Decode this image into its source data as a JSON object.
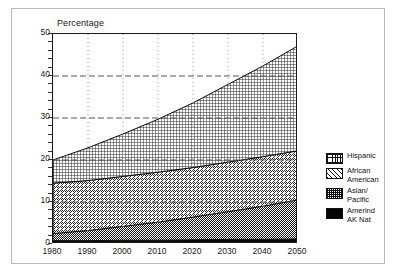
{
  "chart_data": {
    "type": "area",
    "title": "",
    "ylabel": "Percentage",
    "xlabel": "",
    "ylim": [
      0,
      50
    ],
    "xlim": [
      1980,
      2050
    ],
    "grid": true,
    "stacked": true,
    "legend_position": "right",
    "x": [
      1980,
      1990,
      2000,
      2010,
      2020,
      2030,
      2040,
      2050
    ],
    "xticklabels": [
      "1980",
      "1990",
      "2000",
      "2010",
      "2020",
      "2030",
      "2040",
      "2050"
    ],
    "yticklabels": [
      "0",
      "10",
      "20",
      "30",
      "40",
      "50"
    ],
    "yticks": [
      0,
      10,
      20,
      30,
      40,
      50
    ],
    "series": [
      {
        "name": "Amerind AK Nat",
        "pattern": "solid-black",
        "values": [
          0.8,
          0.8,
          0.9,
          0.9,
          1.0,
          1.1,
          1.1,
          1.2
        ]
      },
      {
        "name": "Asian/ Pacific",
        "pattern": "checkerboard",
        "values": [
          1.7,
          2.4,
          3.3,
          4.3,
          5.4,
          6.6,
          7.9,
          9.3
        ]
      },
      {
        "name": "African American",
        "pattern": "diagonal-hatch",
        "values": [
          12.0,
          11.9,
          11.9,
          11.9,
          11.8,
          11.8,
          11.8,
          11.7
        ]
      },
      {
        "name": "Hispanic",
        "pattern": "grid-crosshatch",
        "values": [
          5.5,
          7.8,
          10.1,
          12.6,
          15.4,
          18.5,
          21.6,
          25.0
        ]
      }
    ],
    "cumulative_totals": [
      20.0,
      22.9,
      26.2,
      29.7,
      33.6,
      38.0,
      42.4,
      47.2
    ],
    "annotations": []
  },
  "legend": {
    "items": [
      {
        "label": "Hispanic",
        "swatch": "grid-crosshatch-swatch"
      },
      {
        "label": "African\nAmerican",
        "swatch": "diagonal-hatch-swatch"
      },
      {
        "label": "Asian/\nPacific",
        "swatch": "checkerboard-swatch"
      },
      {
        "label": "Amerind\nAK Nat",
        "swatch": "solid-black-swatch"
      }
    ]
  },
  "colors": {
    "axis": "#1a1a1a",
    "grid_horizontal": "#555555",
    "grid_vertical": "#9a9a9a",
    "page_border": "#b9b9b9",
    "ink": "#111111",
    "background": "#ffffff"
  }
}
